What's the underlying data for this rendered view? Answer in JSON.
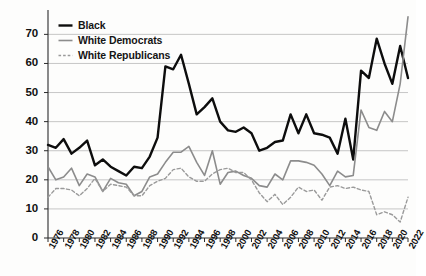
{
  "chart_data": {
    "type": "line",
    "title": "",
    "subtitle": "",
    "xlabel": "",
    "ylabel": "",
    "xlim": [
      1976,
      2022
    ],
    "ylim": [
      0,
      77
    ],
    "yticks": [
      0,
      10,
      20,
      30,
      40,
      50,
      60,
      70
    ],
    "grid": true,
    "legend_position": "top-left",
    "x": [
      1976,
      1977,
      1978,
      1979,
      1980,
      1981,
      1982,
      1983,
      1984,
      1985,
      1986,
      1987,
      1988,
      1989,
      1990,
      1991,
      1992,
      1993,
      1994,
      1995,
      1996,
      1997,
      1998,
      1999,
      2000,
      2001,
      2002,
      2003,
      2004,
      2005,
      2006,
      2007,
      2008,
      2009,
      2010,
      2011,
      2012,
      2013,
      2014,
      2015,
      2016,
      2017,
      2018,
      2019,
      2020,
      2021,
      2022
    ],
    "xtick_labels": [
      "1976",
      "1978",
      "1980",
      "1982",
      "1984",
      "1986",
      "1988",
      "1990",
      "1992",
      "1994",
      "1996",
      "1998",
      "2000",
      "2002",
      "2004",
      "2006",
      "2008",
      "2010",
      "2012",
      "2014",
      "2016",
      "2018",
      "2020",
      "2022"
    ],
    "series": [
      {
        "name": "Black",
        "color": "#0d0d0d",
        "style": "solid",
        "width": 2.4,
        "values": [
          32,
          31,
          34,
          29,
          31,
          33.5,
          25,
          27,
          24.5,
          23,
          21.5,
          24.5,
          24,
          28,
          34.5,
          59,
          58,
          63,
          53,
          42.5,
          45,
          48,
          40,
          37,
          36.5,
          38,
          36,
          30,
          31,
          33,
          33.5,
          42.5,
          36,
          42.5,
          36,
          35.5,
          34.5,
          29,
          41,
          27,
          57.5,
          55,
          68.5,
          60,
          53,
          66,
          55
        ]
      },
      {
        "name": "White Democrats",
        "color": "#8c8c8c",
        "style": "solid",
        "width": 1.6,
        "values": [
          24.5,
          20,
          21,
          24,
          18,
          22,
          21,
          16,
          20.5,
          19,
          18.5,
          14.5,
          16,
          21,
          22,
          26,
          29.5,
          29.5,
          31.5,
          26,
          21.5,
          30,
          18.5,
          22.5,
          23,
          21.5,
          20.5,
          18,
          17.5,
          22,
          20,
          26.5,
          26.5,
          26,
          25,
          22,
          18,
          23,
          21,
          21.5,
          44,
          38,
          37,
          43.5,
          40,
          53,
          76
        ]
      },
      {
        "name": "White Republicans",
        "color": "#9a9a9a",
        "style": "dashed",
        "width": 1.4,
        "values": [
          14,
          17,
          17,
          16.5,
          14.5,
          17,
          20.5,
          16,
          18.5,
          18,
          17.5,
          14.5,
          14.5,
          18,
          19.5,
          20.5,
          23.5,
          24,
          21,
          19.5,
          19.5,
          22,
          23.5,
          24,
          22.5,
          22.5,
          20,
          15.5,
          12.5,
          15,
          11.5,
          14,
          17.5,
          16,
          16.5,
          13,
          17.5,
          18,
          17,
          17.5,
          16.5,
          16,
          8,
          9,
          8,
          5.5,
          14
        ]
      }
    ]
  },
  "legend": {
    "items": [
      {
        "label": "Black"
      },
      {
        "label": "White Democrats"
      },
      {
        "label": "White Republicans"
      }
    ]
  }
}
